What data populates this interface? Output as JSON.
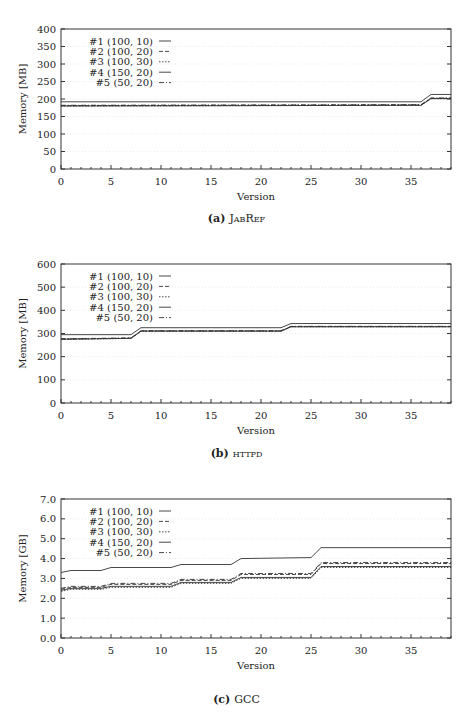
{
  "chart_data": [
    {
      "type": "line",
      "caption_label": "(a)",
      "caption_name": "JabRef",
      "xlabel": "Version",
      "ylabel": "Memory [MB]",
      "xlim": [
        0,
        39
      ],
      "ylim": [
        0,
        400
      ],
      "xticks": [
        0,
        5,
        10,
        15,
        20,
        25,
        30,
        35
      ],
      "yticks": [
        0,
        50,
        100,
        150,
        200,
        250,
        300,
        350,
        400
      ],
      "ytick_labels": [
        "0",
        "50",
        "100",
        "150",
        "200",
        "250",
        "300",
        "350",
        "400"
      ],
      "grid": true,
      "legend_position": "upper left",
      "series": [
        {
          "name": "#1 (100, 10)",
          "dash": "",
          "x": [
            0,
            36,
            37,
            39
          ],
          "y": [
            192,
            192,
            213,
            213
          ]
        },
        {
          "name": "#2 (100, 20)",
          "dash": "4,2",
          "x": [
            0,
            36,
            37,
            39
          ],
          "y": [
            181,
            183,
            202,
            202
          ]
        },
        {
          "name": "#3 (100, 30)",
          "dash": "1.5,1.5",
          "x": [
            0,
            36,
            37,
            39
          ],
          "y": [
            180,
            182,
            201,
            201
          ]
        },
        {
          "name": "#4 (150, 20)",
          "dash": "",
          "x": [
            0,
            36,
            37,
            39
          ],
          "y": [
            180,
            182,
            201,
            201
          ]
        },
        {
          "name": "#5 (50, 20)",
          "dash": "5,2,1,2",
          "x": [
            0,
            36,
            37,
            39
          ],
          "y": [
            182,
            184,
            203,
            203
          ]
        }
      ]
    },
    {
      "type": "line",
      "caption_label": "(b)",
      "caption_name": "httpd",
      "xlabel": "Version",
      "ylabel": "Memory [MB]",
      "xlim": [
        0,
        39
      ],
      "ylim": [
        0,
        600
      ],
      "xticks": [
        0,
        5,
        10,
        15,
        20,
        25,
        30,
        35
      ],
      "yticks": [
        0,
        100,
        200,
        300,
        400,
        500,
        600
      ],
      "ytick_labels": [
        "0",
        "100",
        "200",
        "300",
        "400",
        "500",
        "600"
      ],
      "grid": true,
      "legend_position": "upper left",
      "series": [
        {
          "name": "#1 (100, 10)",
          "dash": "",
          "x": [
            0,
            7,
            8,
            22,
            23,
            39
          ],
          "y": [
            295,
            295,
            325,
            325,
            343,
            343
          ]
        },
        {
          "name": "#2 (100, 20)",
          "dash": "4,2",
          "x": [
            0,
            7,
            8,
            22,
            23,
            39
          ],
          "y": [
            276,
            280,
            311,
            311,
            330,
            330
          ]
        },
        {
          "name": "#3 (100, 30)",
          "dash": "1.5,1.5",
          "x": [
            0,
            7,
            8,
            22,
            23,
            39
          ],
          "y": [
            275,
            279,
            310,
            310,
            329,
            329
          ]
        },
        {
          "name": "#4 (150, 20)",
          "dash": "",
          "x": [
            0,
            7,
            8,
            22,
            23,
            39
          ],
          "y": [
            275,
            279,
            310,
            310,
            329,
            329
          ]
        },
        {
          "name": "#5 (50, 20)",
          "dash": "5,2,1,2",
          "x": [
            0,
            7,
            8,
            22,
            23,
            39
          ],
          "y": [
            277,
            281,
            312,
            312,
            331,
            331
          ]
        }
      ]
    },
    {
      "type": "line",
      "caption_label": "(c)",
      "caption_name": "GCC",
      "xlabel": "Version",
      "ylabel": "Memory [GB]",
      "xlim": [
        0,
        39
      ],
      "ylim": [
        0,
        7
      ],
      "xticks": [
        0,
        5,
        10,
        15,
        20,
        25,
        30,
        35
      ],
      "yticks": [
        0,
        1,
        2,
        3,
        4,
        5,
        6,
        7
      ],
      "ytick_labels": [
        "0.0",
        "1.0",
        "2.0",
        "3.0",
        "4.0",
        "5.0",
        "6.0",
        "7.0"
      ],
      "grid": true,
      "legend_position": "upper left",
      "series": [
        {
          "name": "#1 (100, 10)",
          "dash": "",
          "x": [
            0,
            1,
            4,
            5,
            11,
            12,
            17,
            18,
            25,
            26,
            39
          ],
          "y": [
            3.3,
            3.4,
            3.4,
            3.55,
            3.55,
            3.7,
            3.7,
            4.0,
            4.05,
            4.55,
            4.55
          ]
        },
        {
          "name": "#2 (100, 20)",
          "dash": "4,2",
          "x": [
            0,
            1,
            4,
            5,
            11,
            12,
            17,
            18,
            25,
            26,
            39
          ],
          "y": [
            2.45,
            2.55,
            2.55,
            2.7,
            2.7,
            2.9,
            2.9,
            3.2,
            3.2,
            3.75,
            3.75
          ]
        },
        {
          "name": "#3 (100, 30)",
          "dash": "1.5,1.5",
          "x": [
            0,
            1,
            4,
            5,
            11,
            12,
            17,
            18,
            25,
            26,
            39
          ],
          "y": [
            2.35,
            2.45,
            2.45,
            2.55,
            2.55,
            2.75,
            2.75,
            3.0,
            3.0,
            3.55,
            3.55
          ]
        },
        {
          "name": "#4 (150, 20)",
          "dash": "",
          "x": [
            0,
            1,
            4,
            5,
            11,
            12,
            17,
            18,
            25,
            26,
            39
          ],
          "y": [
            2.4,
            2.5,
            2.5,
            2.6,
            2.6,
            2.8,
            2.8,
            3.05,
            3.05,
            3.6,
            3.6
          ]
        },
        {
          "name": "#5 (50, 20)",
          "dash": "5,2,1,2",
          "x": [
            0,
            1,
            4,
            5,
            11,
            12,
            17,
            18,
            25,
            26,
            39
          ],
          "y": [
            2.5,
            2.6,
            2.6,
            2.75,
            2.75,
            2.95,
            2.95,
            3.25,
            3.25,
            3.8,
            3.8
          ]
        }
      ]
    }
  ],
  "panels": [
    {
      "caption_label": "(a)",
      "caption_name": "JabRef"
    },
    {
      "caption_label": "(b)",
      "caption_name": "httpd"
    },
    {
      "caption_label": "(c)",
      "caption_name": "GCC"
    }
  ],
  "colors": {
    "axis": "#333333",
    "line": "#333333",
    "grid": "#e6e6e6"
  }
}
